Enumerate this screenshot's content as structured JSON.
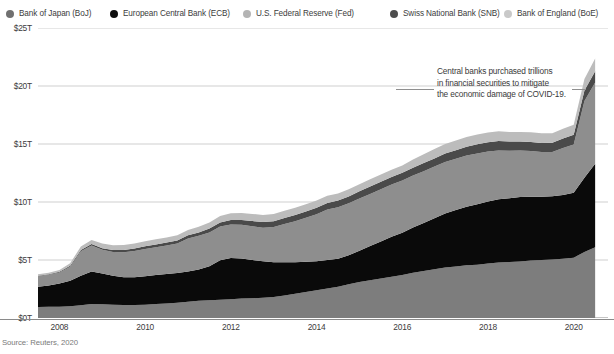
{
  "legend": {
    "items": [
      {
        "label": "Bank of Japan (BoJ)",
        "color": "#707070",
        "x": 6
      },
      {
        "label": "European Central Bank (ECB)",
        "color": "#0d0d0d",
        "x": 110
      },
      {
        "label": "U.S. Federal Reserve (Fed)",
        "color": "#b4b4b4",
        "x": 243
      },
      {
        "label": "Swiss National Bank (SNB)",
        "color": "#4d4d4d",
        "x": 390
      },
      {
        "label": "Bank of England (BoE)",
        "color": "#c9c9c9",
        "x": 504
      }
    ]
  },
  "annotation": {
    "line1": "Central banks purchased trillions",
    "line2": "in financial securities to mitigate",
    "line3": "the economic damage of COVID-19."
  },
  "source": "Source: Reuters, 2020",
  "chart_data": {
    "type": "area",
    "stacked": true,
    "title": "",
    "xlabel": "",
    "ylabel": "",
    "xlim": [
      2007.5,
      2020.8
    ],
    "ylim": [
      0,
      25
    ],
    "grid": true,
    "grid_axis": "y",
    "legend_position": "top",
    "y_ticks": [
      0,
      5,
      10,
      15,
      20,
      25
    ],
    "y_tick_labels": [
      "$0T",
      "$5T",
      "$10T",
      "$15T",
      "$20T",
      "$25T"
    ],
    "x_ticks": [
      2008,
      2010,
      2012,
      2014,
      2016,
      2018,
      2020
    ],
    "x_tick_labels": [
      "2008",
      "2010",
      "2012",
      "2014",
      "2016",
      "2018",
      "2020"
    ],
    "units": "USD trillions",
    "x": [
      2007.5,
      2007.75,
      2008.0,
      2008.25,
      2008.5,
      2008.75,
      2009.0,
      2009.25,
      2009.5,
      2009.75,
      2010.0,
      2010.25,
      2010.5,
      2010.75,
      2011.0,
      2011.25,
      2011.5,
      2011.75,
      2012.0,
      2012.25,
      2012.5,
      2012.75,
      2013.0,
      2013.25,
      2013.5,
      2013.75,
      2014.0,
      2014.25,
      2014.5,
      2014.75,
      2015.0,
      2015.25,
      2015.5,
      2015.75,
      2016.0,
      2016.25,
      2016.5,
      2016.75,
      2017.0,
      2017.25,
      2017.5,
      2017.75,
      2018.0,
      2018.25,
      2018.5,
      2018.75,
      2019.0,
      2019.25,
      2019.5,
      2019.75,
      2020.0,
      2020.25,
      2020.5
    ],
    "series": [
      {
        "name": "Bank of Japan (BoJ)",
        "color": "#7d7d7d",
        "values": [
          0.95,
          0.96,
          0.98,
          1.02,
          1.1,
          1.2,
          1.18,
          1.14,
          1.12,
          1.12,
          1.15,
          1.2,
          1.25,
          1.32,
          1.4,
          1.48,
          1.52,
          1.58,
          1.62,
          1.68,
          1.7,
          1.74,
          1.8,
          1.95,
          2.1,
          2.25,
          2.4,
          2.55,
          2.7,
          2.9,
          3.1,
          3.25,
          3.4,
          3.55,
          3.7,
          3.9,
          4.05,
          4.2,
          4.35,
          4.45,
          4.55,
          4.6,
          4.7,
          4.78,
          4.82,
          4.88,
          4.95,
          5.0,
          5.05,
          5.1,
          5.2,
          5.7,
          6.1
        ]
      },
      {
        "name": "European Central Bank (ECB)",
        "color": "#0a0a0a",
        "values": [
          1.75,
          1.85,
          2.0,
          2.2,
          2.55,
          2.8,
          2.65,
          2.5,
          2.4,
          2.4,
          2.45,
          2.5,
          2.55,
          2.55,
          2.6,
          2.7,
          2.95,
          3.4,
          3.55,
          3.45,
          3.3,
          3.15,
          3.0,
          2.85,
          2.7,
          2.6,
          2.5,
          2.45,
          2.4,
          2.5,
          2.7,
          2.95,
          3.2,
          3.45,
          3.65,
          3.9,
          4.15,
          4.4,
          4.65,
          4.85,
          5.05,
          5.2,
          5.35,
          5.45,
          5.5,
          5.55,
          5.5,
          5.45,
          5.45,
          5.5,
          5.6,
          6.4,
          7.2
        ]
      },
      {
        "name": "U.S. Federal Reserve (Fed)",
        "color": "#8e8e8e",
        "values": [
          0.9,
          0.92,
          0.95,
          1.2,
          2.1,
          2.25,
          2.05,
          2.05,
          2.15,
          2.25,
          2.35,
          2.4,
          2.45,
          2.55,
          2.85,
          2.9,
          2.9,
          2.9,
          2.9,
          2.9,
          2.9,
          2.9,
          3.05,
          3.3,
          3.55,
          3.8,
          4.05,
          4.35,
          4.45,
          4.5,
          4.5,
          4.5,
          4.5,
          4.5,
          4.5,
          4.48,
          4.46,
          4.45,
          4.45,
          4.42,
          4.4,
          4.38,
          4.3,
          4.22,
          4.1,
          4.0,
          3.95,
          3.85,
          3.8,
          4.05,
          4.15,
          6.6,
          7.0
        ]
      },
      {
        "name": "Swiss National Bank (SNB)",
        "color": "#4a4a4a",
        "values": [
          0.05,
          0.05,
          0.06,
          0.08,
          0.11,
          0.12,
          0.14,
          0.17,
          0.2,
          0.22,
          0.23,
          0.24,
          0.25,
          0.26,
          0.28,
          0.3,
          0.34,
          0.36,
          0.38,
          0.42,
          0.46,
          0.48,
          0.5,
          0.52,
          0.53,
          0.54,
          0.55,
          0.56,
          0.57,
          0.58,
          0.62,
          0.64,
          0.65,
          0.66,
          0.67,
          0.68,
          0.7,
          0.71,
          0.73,
          0.75,
          0.77,
          0.79,
          0.8,
          0.8,
          0.79,
          0.78,
          0.78,
          0.79,
          0.8,
          0.82,
          0.84,
          0.92,
          0.98
        ]
      },
      {
        "name": "Bank of England (BoE)",
        "color": "#bcbcbc",
        "values": [
          0.12,
          0.13,
          0.15,
          0.22,
          0.3,
          0.36,
          0.4,
          0.42,
          0.43,
          0.44,
          0.44,
          0.44,
          0.44,
          0.45,
          0.46,
          0.48,
          0.52,
          0.56,
          0.58,
          0.6,
          0.61,
          0.62,
          0.62,
          0.62,
          0.62,
          0.62,
          0.62,
          0.62,
          0.62,
          0.62,
          0.62,
          0.62,
          0.62,
          0.62,
          0.62,
          0.7,
          0.76,
          0.8,
          0.82,
          0.83,
          0.84,
          0.84,
          0.84,
          0.84,
          0.83,
          0.83,
          0.83,
          0.83,
          0.83,
          0.84,
          0.86,
          0.98,
          1.1
        ]
      }
    ],
    "totals_note": "Combined balance sheets of five major central banks"
  }
}
